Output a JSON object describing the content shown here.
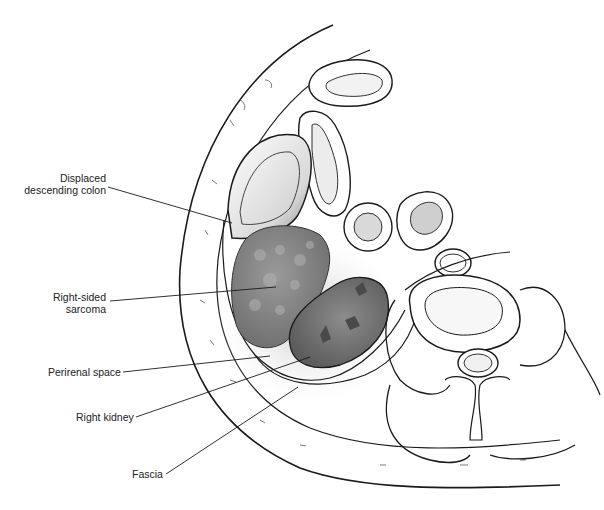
{
  "figure": {
    "type": "anatomical cross-section illustration",
    "labels": [
      {
        "id": "colon",
        "lines": [
          "Displaced",
          "descending colon"
        ]
      },
      {
        "id": "sarcoma",
        "lines": [
          "Right-sided",
          "sarcoma"
        ]
      },
      {
        "id": "perirenal",
        "lines": [
          "Perirenal space"
        ]
      },
      {
        "id": "kidney",
        "lines": [
          "Right kidney"
        ]
      },
      {
        "id": "fascia",
        "lines": [
          "Fascia"
        ]
      }
    ]
  },
  "colors": {
    "line": "#1a1a1a",
    "sarcoma_fill": "#8a8a8a",
    "kidney_fill": "#7a7a7a",
    "shadow": "#bdbdbd",
    "background": "#ffffff"
  }
}
